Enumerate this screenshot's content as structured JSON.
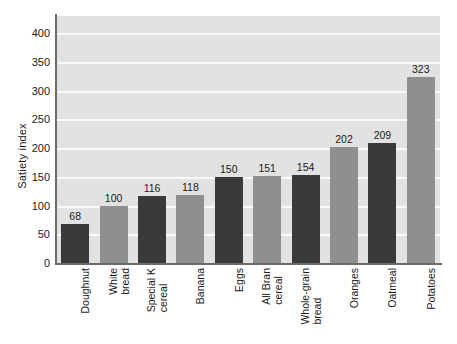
{
  "chart_data": {
    "type": "bar",
    "title": "",
    "xlabel": "",
    "ylabel": "Satiety index",
    "ylim": [
      0,
      430
    ],
    "yticks": [
      0,
      50,
      100,
      150,
      200,
      250,
      300,
      350,
      400
    ],
    "grid": "horizontal",
    "legend": "none",
    "categories": [
      "Doughnut",
      "White bread",
      "Special K cereal",
      "Banana",
      "Eggs",
      "All Bran cereal",
      "Whole-grain bread",
      "Oranges",
      "Oatmeal",
      "Potatoes"
    ],
    "category_lines": [
      [
        "Doughnut"
      ],
      [
        "White",
        "bread"
      ],
      [
        "Special K",
        "cereal"
      ],
      [
        "Banana"
      ],
      [
        "Eggs"
      ],
      [
        "All Bran",
        "cereal"
      ],
      [
        "Whole-grain",
        "bread"
      ],
      [
        "Oranges"
      ],
      [
        "Oatmeal"
      ],
      [
        "Potatoes"
      ]
    ],
    "values": [
      68,
      100,
      116,
      118,
      150,
      151,
      154,
      202,
      209,
      323
    ],
    "bar_colors": [
      "#3a3a3a",
      "#8f8f8f",
      "#3a3a3a",
      "#8f8f8f",
      "#3a3a3a",
      "#8f8f8f",
      "#3a3a3a",
      "#8f8f8f",
      "#3a3a3a",
      "#8f8f8f"
    ],
    "plot_background": "#e2e2e2",
    "gridline_color": "#fafafa",
    "axis_color": "#6b6b6b",
    "text_color": "#1a1a1a"
  }
}
